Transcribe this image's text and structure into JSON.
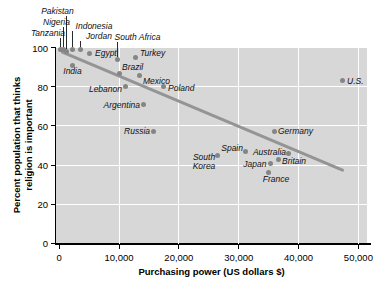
{
  "figure": {
    "xlabel": "Purchasing power (US dollars $)",
    "ylabel_line1": "Percent population that thinks",
    "ylabel_line2": "religion is important"
  },
  "colors": {
    "plot_background": "#d7d7d7",
    "gridline": "#ffffff",
    "dot": "#858585",
    "trend_line": "#949494",
    "leader_line": "#2a2a2a",
    "axis": "#000000",
    "text": "#000000"
  },
  "chart_data": {
    "type": "scatter",
    "title": "",
    "xlabel": "Purchasing power (US dollars $)",
    "ylabel": "Percent population that thinks religion is important",
    "xlim": [
      0,
      50000
    ],
    "ylim": [
      0,
      100
    ],
    "xticks": [
      0,
      10000,
      20000,
      30000,
      40000,
      50000
    ],
    "xtick_labels": [
      "0",
      "10,000",
      "20,000",
      "30,000",
      "40,000",
      "50,000"
    ],
    "yticks": [
      0,
      20,
      40,
      60,
      80,
      100
    ],
    "ytick_labels": [
      "0",
      "20",
      "40",
      "60",
      "80",
      "100"
    ],
    "grid": true,
    "legend": "none",
    "trend_line": {
      "x1": 300,
      "y1": 98,
      "x2": 47600,
      "y2": 37
    },
    "points": [
      {
        "name": "Tanzania",
        "x": 300,
        "y": 99,
        "callout": {
          "label_x": 48,
          "label_y": 32.5
        }
      },
      {
        "name": "Nigeria",
        "x": 800,
        "y": 99,
        "callout": {
          "label_x": 56.5,
          "label_y": 22
        }
      },
      {
        "name": "Pakistan",
        "x": 1300,
        "y": 98,
        "callout": {
          "label_x": 57.5,
          "label_y": 11
        }
      },
      {
        "name": "Indonesia",
        "x": 2300,
        "y": 99,
        "callout": {
          "label_x": 94,
          "label_y": 25.5
        }
      },
      {
        "name": "Jordan",
        "x": 3600,
        "y": 99,
        "callout": {
          "label_x": 99,
          "label_y": 35.5
        }
      },
      {
        "name": "South Africa",
        "x": 9700,
        "y": 94,
        "callout": {
          "label_x": 137.5,
          "label_y": 37
        }
      },
      {
        "name": "Egypt",
        "x": 5100,
        "y": 97,
        "label": {
          "x": 95,
          "y": 52.5,
          "align": "left"
        }
      },
      {
        "name": "India",
        "x": 2300,
        "y": 91,
        "label": {
          "x": 72.5,
          "y": 71,
          "align": "center"
        }
      },
      {
        "name": "Turkey",
        "x": 12700,
        "y": 95,
        "label": {
          "x": 140,
          "y": 53,
          "align": "left"
        }
      },
      {
        "name": "Brazil",
        "x": 10100,
        "y": 87,
        "label": {
          "x": 122,
          "y": 67,
          "align": "left"
        }
      },
      {
        "name": "Mexico",
        "x": 13400,
        "y": 86,
        "label": {
          "x": 143,
          "y": 81,
          "align": "left"
        }
      },
      {
        "name": "Lebanon",
        "x": 11100,
        "y": 80,
        "label": {
          "x": 122,
          "y": 88.5,
          "align": "right"
        }
      },
      {
        "name": "Poland",
        "x": 17400,
        "y": 80,
        "label": {
          "x": 168,
          "y": 87.5,
          "align": "left"
        }
      },
      {
        "name": "Argentina",
        "x": 14100,
        "y": 71,
        "label": {
          "x": 140,
          "y": 104.5,
          "align": "right"
        }
      },
      {
        "name": "Russia",
        "x": 15700,
        "y": 57,
        "label": {
          "x": 150,
          "y": 131,
          "align": "right"
        }
      },
      {
        "name": "Germany",
        "x": 35900,
        "y": 57,
        "label": {
          "x": 278,
          "y": 131,
          "align": "left"
        }
      },
      {
        "name": "Spain",
        "x": 31200,
        "y": 47,
        "label": {
          "x": 243,
          "y": 147.5,
          "align": "right"
        }
      },
      {
        "name": "South Korea",
        "x": 26500,
        "y": 45,
        "label": {
          "x": 204,
          "y": 161.5,
          "align": "center",
          "multiline": true
        }
      },
      {
        "name": "Australia",
        "x": 38400,
        "y": 46,
        "label": {
          "x": 286,
          "y": 152,
          "align": "right"
        }
      },
      {
        "name": "Britain",
        "x": 36600,
        "y": 43,
        "label": {
          "x": 282,
          "y": 160.5,
          "align": "left"
        }
      },
      {
        "name": "Japan",
        "x": 35300,
        "y": 41,
        "label": {
          "x": 266.5,
          "y": 163.5,
          "align": "right"
        }
      },
      {
        "name": "France",
        "x": 34900,
        "y": 36,
        "label": {
          "x": 276,
          "y": 179,
          "align": "center"
        }
      },
      {
        "name": "U.S.",
        "x": 47400,
        "y": 83,
        "label": {
          "x": 347,
          "y": 80.5,
          "align": "left"
        }
      }
    ]
  }
}
